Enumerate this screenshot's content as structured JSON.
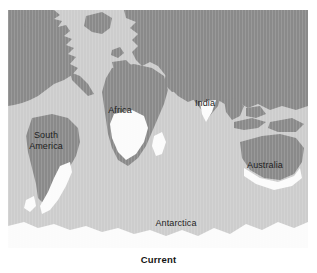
{
  "figure": {
    "caption": "Current",
    "colors": {
      "ocean": "#cdcdcd",
      "land": "#8a8a8a",
      "ice": "#fbfbfb",
      "page_background": "#ffffff",
      "label_text": "#1d1d1d"
    }
  },
  "map": {
    "labels": [
      {
        "name": "south-america",
        "text": "South\nAmerica",
        "x": 34,
        "y": 126
      },
      {
        "name": "africa",
        "text": "Africa",
        "x": 112,
        "y": 100
      },
      {
        "name": "india",
        "text": "India",
        "x": 199,
        "y": 93
      },
      {
        "name": "australia",
        "text": "Australia",
        "x": 252,
        "y": 155
      },
      {
        "name": "antarctica",
        "text": "Antarctica",
        "x": 166,
        "y": 214
      }
    ],
    "landmasses": [
      "North America",
      "Greenland",
      "Europe",
      "Asia",
      "Africa",
      "South America",
      "Australia",
      "Antarctica",
      "Indonesian archipelago",
      "Japan",
      "Madagascar",
      "British Isles"
    ],
    "ice_regions": [
      "Antarctic ice sheet",
      "Southern Africa",
      "Madagascar",
      "Southern South America",
      "Indian peninsula",
      "Southern Australia"
    ]
  }
}
